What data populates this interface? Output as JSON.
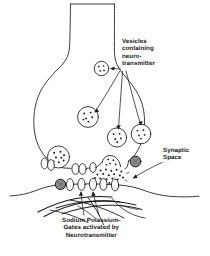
{
  "figure": {
    "style": "black and white line drawing, scanned",
    "background_color": "#ffffff",
    "ink_color": "#1a1a1a",
    "vesicle_fill": "#ffffff",
    "gate_fill": "#fdfdfd",
    "dark_circle_fill": "#8a8a8a"
  },
  "labels": {
    "vesicles": {
      "name": "vesicles-containing-neurotransmitter",
      "lines": [
        "Vesicles",
        "containing",
        "neuro-",
        "transmitter"
      ]
    },
    "synaptic_space": {
      "name": "synaptic-space",
      "lines": [
        "Synaptic",
        "Space"
      ]
    },
    "gates": {
      "name": "sodium-potassium-gates",
      "lines": [
        "Sodium Potassium-",
        "Gates activated by",
        "Neurotransmitter"
      ]
    }
  },
  "structures": {
    "axon_terminal": "axon-terminal-bouton",
    "presynaptic_membrane": "presynaptic-membrane",
    "postsynaptic_membrane": "postsynaptic-membrane",
    "dendrite_fibers": "dendrite-fibers",
    "synaptic_cleft": "synaptic-cleft",
    "vesicle_count": 6,
    "receptor_gate_count": 10,
    "dark_receptor_count": 2,
    "free_neurotransmitter_dots": 18
  }
}
